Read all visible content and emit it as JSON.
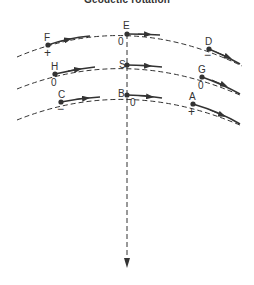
{
  "title": "Geodetic rotation",
  "points": [
    {
      "id": "F",
      "label": "F",
      "sign": "+"
    },
    {
      "id": "E",
      "label": "E",
      "sign": "0"
    },
    {
      "id": "D",
      "label": "D",
      "sign": "−"
    },
    {
      "id": "H",
      "label": "H",
      "sign": "0"
    },
    {
      "id": "S",
      "label": "S",
      "sign": ""
    },
    {
      "id": "G",
      "label": "G",
      "sign": "0"
    },
    {
      "id": "C",
      "label": "C",
      "sign": "−"
    },
    {
      "id": "B",
      "label": "B",
      "sign": "0"
    },
    {
      "id": "A",
      "label": "A",
      "sign": "+"
    }
  ],
  "orbits": [
    {
      "name": "outer",
      "points": [
        "F",
        "E",
        "D"
      ]
    },
    {
      "name": "middle",
      "points": [
        "H",
        "S",
        "G"
      ]
    },
    {
      "name": "inner",
      "points": [
        "C",
        "B",
        "A"
      ]
    }
  ],
  "colors": {
    "ink": "#333333",
    "background": "#ffffff"
  }
}
